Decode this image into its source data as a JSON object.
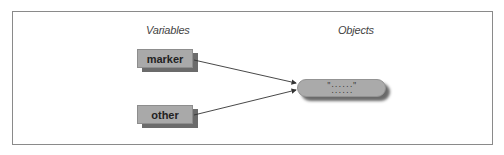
{
  "diagram": {
    "columns": {
      "variables_label": "Variables",
      "objects_label": "Objects"
    },
    "variables": [
      {
        "name": "marker"
      },
      {
        "name": "other"
      }
    ],
    "object": {
      "line1": "\"......\"",
      "line2": "......"
    },
    "colors": {
      "box_fill": "#a9a9a9",
      "box_shadow": "#6b6b6b",
      "frame_border": "#8a8a8a",
      "arrow": "#333333"
    }
  }
}
